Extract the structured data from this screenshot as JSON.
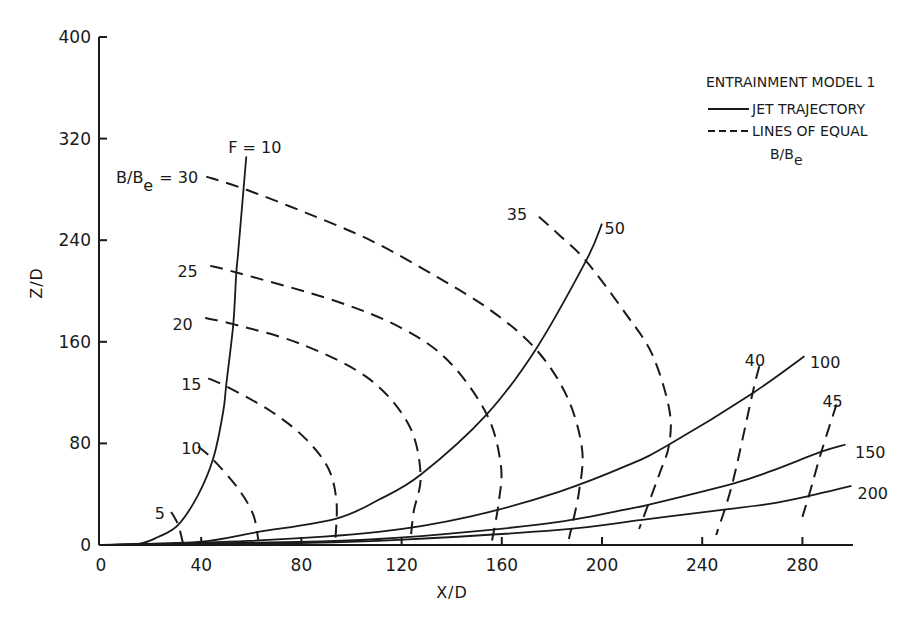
{
  "chart_data": {
    "type": "line",
    "title": "",
    "xlabel": "X/D",
    "ylabel": "Z/D",
    "xlim": [
      0,
      300
    ],
    "ylim": [
      0,
      400
    ],
    "grid": false,
    "x_ticks": [
      0,
      40,
      80,
      120,
      160,
      200,
      240,
      280
    ],
    "y_ticks": [
      0,
      80,
      160,
      240,
      320,
      400
    ],
    "legend": {
      "position": "upper right",
      "title": "ENTRAINMENT MODEL 1",
      "entries": [
        {
          "style": "solid",
          "label": "JET TRAJECTORY"
        },
        {
          "style": "dashed",
          "label": "LINES OF EQUAL",
          "label2": "B/B",
          "label2_sub": "e"
        }
      ]
    },
    "trajectories": [
      {
        "name": "F = 10",
        "label": "F = 10",
        "label_pos": [
          50.8,
          313.5
        ],
        "points": [
          [
            0,
            0
          ],
          [
            14.8,
            0.8
          ],
          [
            22.8,
            6.3
          ],
          [
            30.8,
            15.8
          ],
          [
            38.8,
            39.5
          ],
          [
            44.8,
            68
          ],
          [
            48.8,
            105.1
          ],
          [
            50,
            126.5
          ],
          [
            52.8,
            173.9
          ],
          [
            54,
            214.2
          ],
          [
            54.8,
            231.6
          ],
          [
            58,
            305.9
          ]
        ]
      },
      {
        "name": "F = 50",
        "label": "50",
        "label_pos": [
          201,
          250
        ],
        "points": [
          [
            0,
            0
          ],
          [
            38.8,
            2.4
          ],
          [
            62.8,
            10.3
          ],
          [
            93.6,
            20.6
          ],
          [
            110.8,
            35.6
          ],
          [
            127.6,
            55.3
          ],
          [
            154,
            102.8
          ],
          [
            173.6,
            154.2
          ],
          [
            193.6,
            223.7
          ],
          [
            200,
            253
          ]
        ]
      },
      {
        "name": "F = 100",
        "label": "100",
        "label_pos": [
          283,
          144
        ],
        "points": [
          [
            0,
            0
          ],
          [
            58.8,
            3.2
          ],
          [
            110.8,
            10.3
          ],
          [
            146.8,
            22.1
          ],
          [
            182.8,
            41.9
          ],
          [
            210.8,
            63.2
          ],
          [
            226.8,
            79.1
          ],
          [
            260,
            119.4
          ],
          [
            280.8,
            148.6
          ]
        ]
      },
      {
        "name": "F = 150",
        "label": "150",
        "label_pos": [
          301,
          73
        ],
        "points": [
          [
            0,
            0
          ],
          [
            78.8,
            2.4
          ],
          [
            110.8,
            4.7
          ],
          [
            146.8,
            10.3
          ],
          [
            182.8,
            18.2
          ],
          [
            210.8,
            28.5
          ],
          [
            220,
            32.4
          ],
          [
            252,
            48.2
          ],
          [
            266.8,
            57.7
          ],
          [
            287.6,
            73.5
          ],
          [
            297.2,
            79.1
          ]
        ]
      },
      {
        "name": "F = 200",
        "label": "200",
        "label_pos": [
          302,
          41
        ],
        "points": [
          [
            0,
            0
          ],
          [
            78.8,
            1.6
          ],
          [
            118.8,
            4
          ],
          [
            182.8,
            11.9
          ],
          [
            216,
            19.8
          ],
          [
            248,
            27.7
          ],
          [
            266.8,
            32.4
          ],
          [
            282.8,
            38.7
          ],
          [
            299.6,
            46.6
          ]
        ]
      }
    ],
    "equal_lines": [
      {
        "name": "B/Be = 5",
        "label": "5",
        "label_pos": [
          21.5,
          25
        ],
        "points": [
          [
            28,
            26.1
          ],
          [
            30.8,
            15.8
          ],
          [
            32.8,
            0.8
          ]
        ]
      },
      {
        "name": "B/Be = 10",
        "label": "10",
        "label_pos": [
          32,
          76
        ],
        "points": [
          [
            38.8,
            77.5
          ],
          [
            44.8,
            67.2
          ],
          [
            54.8,
            44.3
          ],
          [
            60.8,
            23.7
          ],
          [
            62.8,
            4
          ]
        ]
      },
      {
        "name": "B/Be = 15",
        "label": "15",
        "label_pos": [
          32,
          127
        ],
        "points": [
          [
            42.8,
            131.2
          ],
          [
            50,
            124.9
          ],
          [
            68,
            105.1
          ],
          [
            81.6,
            83.8
          ],
          [
            90.8,
            60.1
          ],
          [
            94,
            34
          ],
          [
            93.6,
            4.7
          ]
        ]
      },
      {
        "name": "B/Be = 20",
        "label": "20",
        "label_pos": [
          28.5,
          174
        ],
        "points": [
          [
            41.6,
            178.7
          ],
          [
            52.8,
            173.9
          ],
          [
            80,
            158.1
          ],
          [
            106.8,
            131.2
          ],
          [
            122.8,
            94.9
          ],
          [
            127.6,
            55.3
          ],
          [
            124.8,
            26.1
          ],
          [
            123.6,
            4
          ]
        ]
      },
      {
        "name": "B/Be = 25",
        "label": "25",
        "label_pos": [
          30.5,
          216
        ],
        "points": [
          [
            43.6,
            219.8
          ],
          [
            54.8,
            214.2
          ],
          [
            93.6,
            192.1
          ],
          [
            120,
            170.8
          ],
          [
            138.8,
            144.7
          ],
          [
            154,
            102.8
          ],
          [
            159.6,
            63.2
          ],
          [
            158.8,
            34
          ],
          [
            156,
            2.4
          ]
        ]
      },
      {
        "name": "B/Be = 30",
        "label": "= 30",
        "label_prefix": "B/B",
        "label_sub": "e",
        "label_pos": [
          6,
          290
        ],
        "points": [
          [
            42,
            290.1
          ],
          [
            56.8,
            280.6
          ],
          [
            81.6,
            261.7
          ],
          [
            108,
            239.5
          ],
          [
            134.8,
            210.3
          ],
          [
            156,
            184.2
          ],
          [
            173.6,
            154.2
          ],
          [
            186,
            117
          ],
          [
            192,
            75.9
          ],
          [
            190.8,
            41.9
          ],
          [
            186.8,
            4.7
          ]
        ]
      },
      {
        "name": "B/Be = 35",
        "label": "35",
        "label_pos": [
          162,
          261
        ],
        "points": [
          [
            174.8,
            258.5
          ],
          [
            182.8,
            244.3
          ],
          [
            193.6,
            223.7
          ],
          [
            209.6,
            181.8
          ],
          [
            220,
            150.2
          ],
          [
            226.8,
            107.5
          ],
          [
            226.8,
            79.1
          ],
          [
            222.8,
            55.3
          ],
          [
            214.8,
            12.6
          ]
        ]
      },
      {
        "name": "B/Be = 40",
        "label": "40",
        "label_pos": [
          257,
          146
        ],
        "points": [
          [
            262.8,
            140.7
          ],
          [
            260,
            118.6
          ],
          [
            252,
            48.2
          ],
          [
            245.6,
            7.9
          ]
        ]
      },
      {
        "name": "B/Be = 45",
        "label": "45",
        "label_pos": [
          288,
          113
        ],
        "points": [
          [
            293.6,
            110.7
          ],
          [
            287.6,
            73.5
          ],
          [
            282.8,
            40.3
          ],
          [
            280,
            22.1
          ]
        ]
      }
    ]
  },
  "axes": {
    "x_title": "X/D",
    "y_title": "Z/D"
  }
}
